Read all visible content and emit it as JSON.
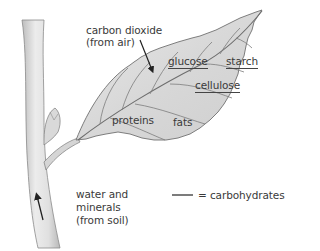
{
  "diagram": {
    "labels": {
      "co2_line1": "carbon dioxide",
      "co2_line2": "(from air)",
      "glucose": "glucose",
      "starch": "starch",
      "cellulose": "cellulose",
      "proteins": "proteins",
      "fats": "fats",
      "water_line1": "water and",
      "water_line2": "minerals",
      "water_line3": "(from soil)"
    },
    "carbohydrates_underlined": [
      "glucose",
      "starch",
      "cellulose"
    ],
    "legend": {
      "symbol": "underline",
      "text": "= carbohydrates"
    },
    "arrows": [
      {
        "name": "carbon-dioxide-arrow",
        "direction": "into leaf"
      },
      {
        "name": "water-arrow",
        "direction": "up stem"
      }
    ],
    "colors": {
      "leaf_fill": "#dcdcdc",
      "stem_fill": "#e2e2e2",
      "outline": "#777777",
      "text": "#3a3a3a"
    }
  }
}
